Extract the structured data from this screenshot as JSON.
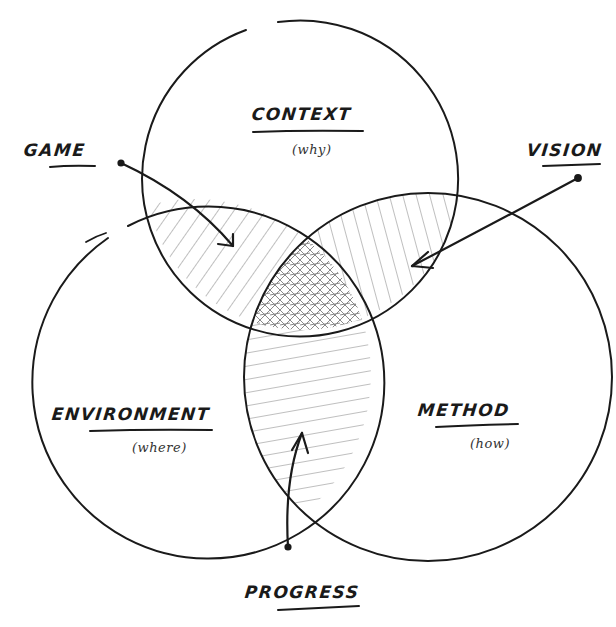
{
  "diagram": {
    "type": "venn",
    "style": "hand-drawn",
    "colors": {
      "stroke": "#1a1a1a",
      "hatch": "#8a8a8a",
      "background": "#ffffff"
    },
    "sets": [
      {
        "id": "context",
        "label": "CONTEXT",
        "sublabel": "(why)"
      },
      {
        "id": "environment",
        "label": "ENVIRONMENT",
        "sublabel": "(where)"
      },
      {
        "id": "method",
        "label": "METHOD",
        "sublabel": "(how)"
      }
    ],
    "intersections": [
      {
        "label": "GAME",
        "sets": [
          "context",
          "environment"
        ],
        "hatch": "diagonal"
      },
      {
        "label": "VISION",
        "sets": [
          "context",
          "method"
        ],
        "hatch": "diagonal-steep"
      },
      {
        "label": "PROGRESS",
        "sets": [
          "environment",
          "method"
        ],
        "hatch": "horizontal"
      },
      {
        "label": "",
        "sets": [
          "context",
          "environment",
          "method"
        ],
        "hatch": "cross-hatch"
      }
    ]
  },
  "labels": {
    "context": "CONTEXT",
    "context_sub": "(why)",
    "environment": "ENVIRONMENT",
    "environment_sub": "(where)",
    "method": "METHOD",
    "method_sub": "(how)",
    "game": "GAME",
    "vision": "VISION",
    "progress": "PROGRESS"
  }
}
